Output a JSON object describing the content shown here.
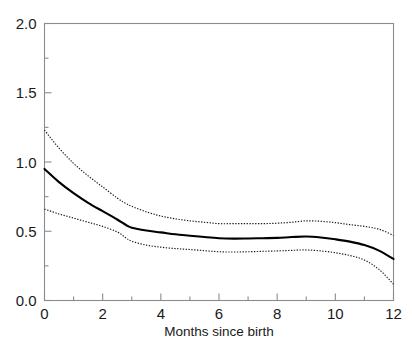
{
  "chart_data": {
    "type": "line",
    "title": "",
    "subtitle": "",
    "xlabel": "Months since birth",
    "ylabel": "",
    "xlim": [
      0,
      12
    ],
    "ylim": [
      0,
      2.0
    ],
    "grid": false,
    "legend": false,
    "legend_position": "none",
    "x_ticks_major": [
      0,
      2,
      4,
      6,
      8,
      10,
      12
    ],
    "x_ticks_major_labels": [
      "0",
      "2",
      "4",
      "6",
      "8",
      "10",
      "12"
    ],
    "x_ticks_minor": [
      1,
      3,
      5,
      7,
      9,
      11
    ],
    "y_ticks_major": [
      0.0,
      0.5,
      1.0,
      1.5,
      2.0
    ],
    "y_ticks_major_labels": [
      "0.0",
      "0.5",
      "1.0",
      "1.5",
      "2.0"
    ],
    "y_ticks_minor": [
      0.25,
      0.75,
      1.25,
      1.75
    ],
    "x": [
      0,
      0.5,
      1,
      1.5,
      2,
      2.5,
      2.8,
      3,
      3.5,
      4,
      4.5,
      5,
      5.5,
      6,
      6.5,
      7,
      7.5,
      8,
      8.5,
      9,
      9.5,
      10,
      10.5,
      11,
      11.5,
      12
    ],
    "series": [
      {
        "name": "upper-confidence-band",
        "style": "dotted",
        "color": "#1a1a1a",
        "values": [
          1.23,
          1.1,
          0.99,
          0.9,
          0.82,
          0.74,
          0.7,
          0.68,
          0.64,
          0.61,
          0.59,
          0.575,
          0.565,
          0.555,
          0.555,
          0.555,
          0.555,
          0.558,
          0.565,
          0.575,
          0.572,
          0.562,
          0.548,
          0.535,
          0.515,
          0.47
        ]
      },
      {
        "name": "estimate",
        "style": "solid",
        "color": "#000000",
        "values": [
          0.95,
          0.855,
          0.775,
          0.705,
          0.645,
          0.585,
          0.545,
          0.525,
          0.505,
          0.492,
          0.478,
          0.468,
          0.458,
          0.45,
          0.447,
          0.448,
          0.45,
          0.452,
          0.458,
          0.462,
          0.455,
          0.442,
          0.425,
          0.4,
          0.36,
          0.3
        ]
      },
      {
        "name": "lower-confidence-band",
        "style": "dotted",
        "color": "#1a1a1a",
        "values": [
          0.66,
          0.625,
          0.595,
          0.565,
          0.535,
          0.495,
          0.452,
          0.428,
          0.4,
          0.385,
          0.375,
          0.368,
          0.36,
          0.352,
          0.35,
          0.352,
          0.355,
          0.358,
          0.362,
          0.365,
          0.358,
          0.345,
          0.325,
          0.292,
          0.225,
          0.118
        ]
      }
    ],
    "annotations": []
  },
  "axes": {
    "x_axis_title": "Months since birth",
    "y_axis_title": ""
  }
}
